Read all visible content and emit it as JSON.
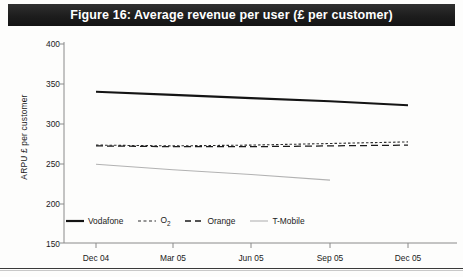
{
  "figure": {
    "title": "Figure 16: Average revenue per user (£ per customer)",
    "title_bar_color": "#242424"
  },
  "chart_data": {
    "type": "line",
    "title": "Figure 16: Average revenue per user (£ per customer)",
    "xlabel": "",
    "ylabel": "ARPU £ per customer",
    "x": [
      "Dec 04",
      "Mar 05",
      "Jun 05",
      "Sep 05",
      "Dec 05"
    ],
    "xlim": [
      "Dec 04",
      "Dec 05"
    ],
    "ylim": [
      150,
      400
    ],
    "yticks": [
      150,
      200,
      250,
      300,
      350,
      400
    ],
    "xticks": [
      "Dec 04",
      "Mar 05",
      "Jun 05",
      "Sep 05",
      "Dec 05"
    ],
    "grid": false,
    "legend_position": "bottom-left",
    "series": [
      {
        "name": "Vodafone",
        "style": "solid-thick",
        "color": "#1a1a1a",
        "values": [
          340,
          336,
          332,
          328,
          323
        ]
      },
      {
        "name": "O2",
        "style": "dotted",
        "color": "#2a2a2a",
        "values": [
          273,
          272,
          273,
          275,
          277
        ]
      },
      {
        "name": "Orange",
        "style": "dashed",
        "color": "#1a1a1a",
        "values": [
          272,
          271,
          271,
          272,
          273
        ]
      },
      {
        "name": "T-Mobile",
        "style": "solid-thin",
        "color": "#aeaeae",
        "values": [
          249,
          242,
          236,
          229,
          null
        ]
      }
    ]
  },
  "axes": {
    "y_title": "ARPU £ per customer",
    "y_ticks": [
      "400",
      "350",
      "300",
      "250",
      "200",
      "150"
    ],
    "x_ticks": [
      "Dec 04",
      "Mar 05",
      "Jun 05",
      "Sep 05",
      "Dec 05"
    ]
  },
  "legend": {
    "items": [
      {
        "label": "Vodafone",
        "sub": ""
      },
      {
        "label": "O",
        "sub": "2"
      },
      {
        "label": "Orange",
        "sub": ""
      },
      {
        "label": "T-Mobile",
        "sub": ""
      }
    ]
  }
}
